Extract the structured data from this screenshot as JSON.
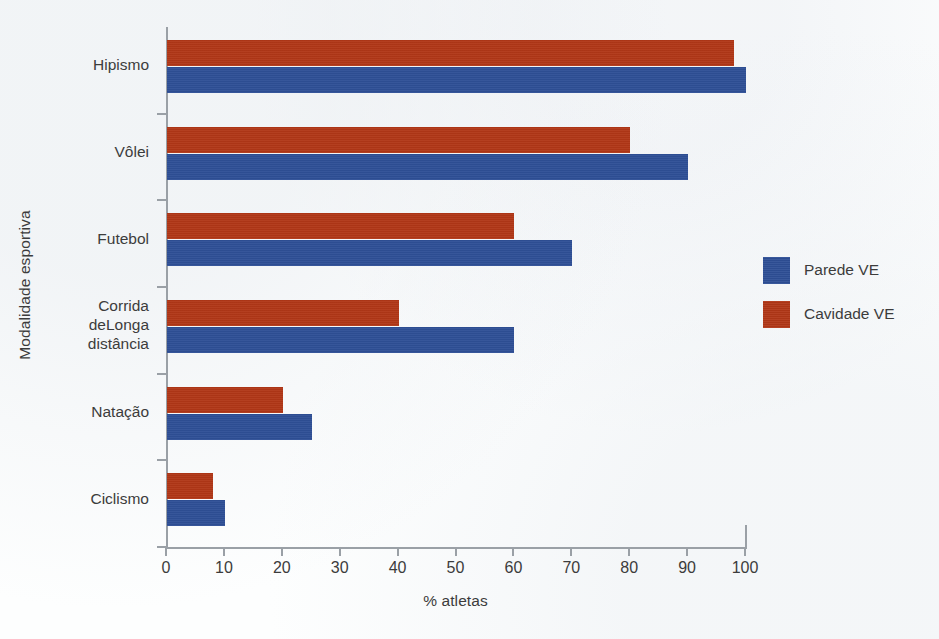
{
  "chart_data": {
    "type": "bar",
    "orientation": "horizontal",
    "title": "",
    "xlabel": "% atletas",
    "ylabel": "Modalidade esportiva",
    "xlim": [
      0,
      100
    ],
    "xticks": [
      0,
      10,
      20,
      30,
      40,
      50,
      60,
      70,
      80,
      90,
      100
    ],
    "xtick_labels": [
      "0",
      "10",
      "20",
      "30",
      "40",
      "50",
      "60",
      "70",
      "80",
      "90",
      "100"
    ],
    "grid": false,
    "legend_position": "right",
    "categories": [
      "Hipismo",
      "Vôlei",
      "Futebol",
      "Corrida\ndeLonga\ndistância",
      "Natação",
      "Ciclismo"
    ],
    "series": [
      {
        "name": "Parede VE",
        "color": "#2e4f96",
        "values": [
          10,
          25,
          60,
          70,
          90,
          100
        ]
      },
      {
        "name": "Cavidade VE",
        "color": "#b13717",
        "values": [
          8,
          20,
          40,
          60,
          80,
          98
        ]
      }
    ]
  },
  "axes": {
    "y_title": "Modalidade esportiva",
    "x_title": "% atletas"
  },
  "legend": {
    "entries": [
      {
        "label": "Parede VE",
        "color": "#2e4f96",
        "swatch": "blue-swatch-icon"
      },
      {
        "label": "Cavidade VE",
        "color": "#b13717",
        "swatch": "red-swatch-icon"
      }
    ]
  }
}
